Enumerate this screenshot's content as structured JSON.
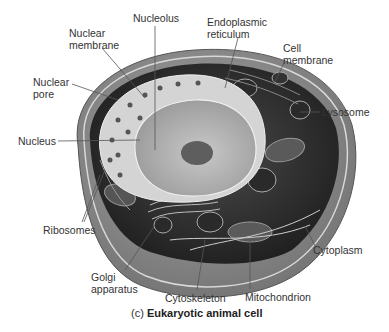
{
  "figure": {
    "caption_prefix": "(c)",
    "caption_title": "Eukaryotic animal cell",
    "style": "grayscale cutaway illustration",
    "colors": {
      "background": "#ffffff",
      "cell_shell": "#8a8a8a",
      "cytoplasm": "#3a3a3a",
      "nucleus": "#bdbdbd",
      "nuclear_envelope": "#d6d6d6",
      "nucleolus": "#5a5a5a",
      "label_text": "#333333",
      "leader_line": "#555555"
    }
  },
  "labels": {
    "nucleolus": "Nucleolus",
    "nuclear_membrane": "Nuclear\nmembrane",
    "endoplasmic_reticulum": "Endoplasmic\nreticulum",
    "cell_membrane": "Cell\nmembrane",
    "nuclear_pore": "Nuclear\npore",
    "lysosome": "Lysosome",
    "nucleus": "Nucleus",
    "ribosomes": "Ribosomes",
    "cytoplasm": "Cytoplasm",
    "golgi_apparatus": "Golgi\napparatus",
    "cytoskeleton": "Cytoskeleton",
    "mitochondrion": "Mitochondrion"
  }
}
